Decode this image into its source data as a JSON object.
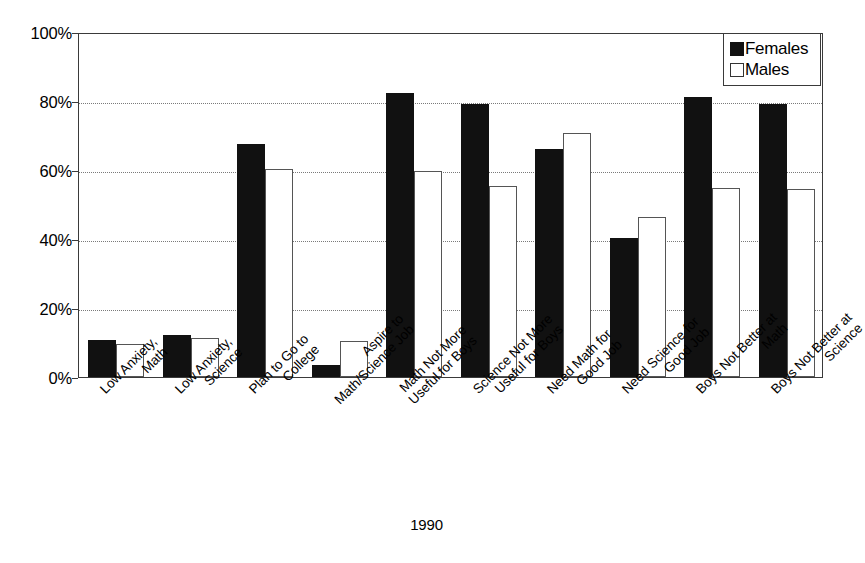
{
  "chart_data": {
    "type": "bar",
    "title": "",
    "xlabel": "1990",
    "ylabel": "",
    "ylim": [
      0,
      100
    ],
    "y_ticks": [
      "0%",
      "20%",
      "40%",
      "60%",
      "80%",
      "100%"
    ],
    "y_tick_values": [
      0,
      20,
      40,
      60,
      80,
      100
    ],
    "grid": "horizontal-dotted",
    "legend_position": "top-right",
    "categories": [
      "Low Anxiety, Math",
      "Low Anxiety, Science",
      "Plan to Go to College",
      "Aspire to Math/Science Job",
      "Math Not More Useful for Boys",
      "Science Not More Useful for Boys",
      "Need Math for Good Job",
      "Need Science for Good Job",
      "Boys Not Better at Math",
      "Boys Not Better at Science"
    ],
    "category_lines": [
      [
        "Low Anxiety,",
        "Math"
      ],
      [
        "Low Anxiety,",
        "Science"
      ],
      [
        "Plan to Go to",
        "College"
      ],
      [
        "Aspire to",
        "Math/Science Job"
      ],
      [
        "Math Not More",
        "Useful for Boys"
      ],
      [
        "Science Not More",
        "Useful for Boys"
      ],
      [
        "Need Math for",
        "Good Job"
      ],
      [
        "Need Science for",
        "Good Job"
      ],
      [
        "Boys Not Better at",
        "Math"
      ],
      [
        "Boys Not Better at",
        "Science"
      ]
    ],
    "series": [
      {
        "name": "Females",
        "color": "#111111",
        "style": "filled",
        "values": [
          10.7,
          12.2,
          67.5,
          3.5,
          82.3,
          79.1,
          66.0,
          40.3,
          81.2,
          79.0
        ]
      },
      {
        "name": "Males",
        "color": "#ffffff",
        "style": "open",
        "values": [
          9.6,
          11.3,
          60.3,
          10.5,
          59.7,
          55.3,
          70.6,
          46.4,
          54.8,
          54.6
        ]
      }
    ]
  },
  "legend": {
    "items": [
      {
        "label": "Females",
        "swatch": "filled-square-icon"
      },
      {
        "label": "Males",
        "swatch": "open-square-icon"
      }
    ]
  },
  "axis": {
    "x_title": "1990"
  }
}
